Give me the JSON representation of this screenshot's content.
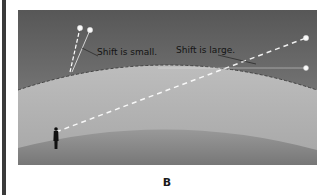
{
  "figure": {
    "caption": "B",
    "labels": {
      "small_shift": "Shift is small.",
      "large_shift": "Shift is large."
    },
    "colors": {
      "sky_top": "#5a5a5a",
      "sky_bottom": "#8a8a8a",
      "atmosphere": "#b4b4b4",
      "ground_top": "#9a9a9a",
      "ground_bottom": "#7a7a7a",
      "star": "#ffffff",
      "sightline": "#ffffff",
      "observer": "#111111"
    },
    "elements": {
      "observer": "person-silhouette",
      "near_stars": 2,
      "far_stars": 2
    }
  }
}
